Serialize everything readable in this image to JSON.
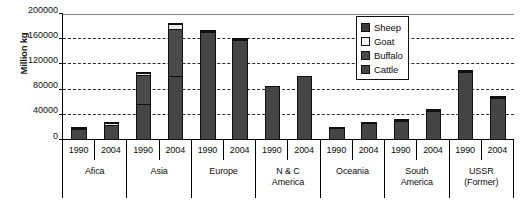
{
  "chart_data": {
    "type": "bar",
    "title": "",
    "subtitle": "",
    "xlabel": "",
    "ylabel": "Million kg",
    "ylim": [
      0,
      200000
    ],
    "ytick_interval": 40000,
    "yticks": [
      200000,
      160000,
      120000,
      80000,
      40000,
      0
    ],
    "ytick_labels": [
      "200000",
      "160000",
      "120000",
      "80000",
      "40000",
      "0"
    ],
    "grid": "horizontal-dashed",
    "stacked": true,
    "legend_position": "top-right",
    "legend": [
      "Sheep",
      "Goat",
      "Buffalo",
      "Cattle"
    ],
    "categories": [
      "Afica 1990",
      "Afica 2004",
      "Asia 1990",
      "Asia 2004",
      "Europe 1990",
      "Europe 2004",
      "N & C America 1990",
      "N & C America 2004",
      "Oceania 1990",
      "Oceania 2004",
      "South America 1990",
      "South America 2004",
      "USSR (Former) 1990",
      "USSR (Former) 2004"
    ],
    "series": [
      {
        "name": "Cattle",
        "color": "#454545",
        "values": [
          18000,
          25000,
          58000,
          102000,
          173000,
          160000,
          86000,
          101000,
          19500,
          28000,
          33000,
          49000,
          110000,
          69000
        ]
      },
      {
        "name": "Buffalo",
        "color": "#4a4a4a",
        "values": [
          0,
          0,
          46000,
          74000,
          0,
          0,
          0,
          0,
          0,
          0,
          0,
          0,
          0,
          0
        ]
      },
      {
        "name": "Goat",
        "color": "#e8e8e8",
        "values": [
          1600,
          2200,
          4000,
          9000,
          1000,
          900,
          0,
          0,
          0,
          0,
          800,
          700,
          900,
          700
        ]
      },
      {
        "name": "Sheep",
        "color": "#3a3a3a",
        "values": [
          800,
          800,
          700,
          1000,
          500,
          400,
          0,
          0,
          500,
          700,
          300,
          300,
          400,
          300
        ]
      }
    ],
    "regions": [
      {
        "name": "Afica",
        "name_lines": [
          "Afica"
        ],
        "years": [
          "1990",
          "2004"
        ],
        "bars": [
          {
            "year": "1990",
            "total": 20400,
            "segments": [
              {
                "series": "Cattle",
                "value": 18000
              },
              {
                "series": "Buffalo",
                "value": 0
              },
              {
                "series": "Goat",
                "value": 1600
              },
              {
                "series": "Sheep",
                "value": 800
              }
            ]
          },
          {
            "year": "2004",
            "total": 28000,
            "segments": [
              {
                "series": "Cattle",
                "value": 25000
              },
              {
                "series": "Buffalo",
                "value": 0
              },
              {
                "series": "Goat",
                "value": 2200
              },
              {
                "series": "Sheep",
                "value": 800
              }
            ]
          }
        ]
      },
      {
        "name": "Asia",
        "name_lines": [
          "Asia"
        ],
        "years": [
          "1990",
          "2004"
        ],
        "bars": [
          {
            "year": "1990",
            "total": 108700,
            "segments": [
              {
                "series": "Cattle",
                "value": 58000
              },
              {
                "series": "Buffalo",
                "value": 46000
              },
              {
                "series": "Goat",
                "value": 4000
              },
              {
                "series": "Sheep",
                "value": 700
              }
            ]
          },
          {
            "year": "2004",
            "total": 186000,
            "segments": [
              {
                "series": "Cattle",
                "value": 102000
              },
              {
                "series": "Buffalo",
                "value": 74000
              },
              {
                "series": "Goat",
                "value": 9000
              },
              {
                "series": "Sheep",
                "value": 1000
              }
            ]
          }
        ]
      },
      {
        "name": "Europe",
        "name_lines": [
          "Europe"
        ],
        "years": [
          "1990",
          "2004"
        ],
        "bars": [
          {
            "year": "1990",
            "total": 174500,
            "segments": [
              {
                "series": "Cattle",
                "value": 173000
              },
              {
                "series": "Buffalo",
                "value": 0
              },
              {
                "series": "Goat",
                "value": 1000
              },
              {
                "series": "Sheep",
                "value": 500
              }
            ]
          },
          {
            "year": "2004",
            "total": 161300,
            "segments": [
              {
                "series": "Cattle",
                "value": 160000
              },
              {
                "series": "Buffalo",
                "value": 0
              },
              {
                "series": "Goat",
                "value": 900
              },
              {
                "series": "Sheep",
                "value": 400
              }
            ]
          }
        ]
      },
      {
        "name": "N & C America",
        "name_lines": [
          "N & C",
          "America"
        ],
        "years": [
          "1990",
          "2004"
        ],
        "bars": [
          {
            "year": "1990",
            "total": 86000,
            "segments": [
              {
                "series": "Cattle",
                "value": 86000
              },
              {
                "series": "Buffalo",
                "value": 0
              },
              {
                "series": "Goat",
                "value": 0
              },
              {
                "series": "Sheep",
                "value": 0
              }
            ]
          },
          {
            "year": "2004",
            "total": 101000,
            "segments": [
              {
                "series": "Cattle",
                "value": 101000
              },
              {
                "series": "Buffalo",
                "value": 0
              },
              {
                "series": "Goat",
                "value": 0
              },
              {
                "series": "Sheep",
                "value": 0
              }
            ]
          }
        ]
      },
      {
        "name": "Oceania",
        "name_lines": [
          "Oceania"
        ],
        "years": [
          "1990",
          "2004"
        ],
        "bars": [
          {
            "year": "1990",
            "total": 20000,
            "segments": [
              {
                "series": "Cattle",
                "value": 19500
              },
              {
                "series": "Buffalo",
                "value": 0
              },
              {
                "series": "Goat",
                "value": 0
              },
              {
                "series": "Sheep",
                "value": 500
              }
            ]
          },
          {
            "year": "2004",
            "total": 28700,
            "segments": [
              {
                "series": "Cattle",
                "value": 28000
              },
              {
                "series": "Buffalo",
                "value": 0
              },
              {
                "series": "Goat",
                "value": 0
              },
              {
                "series": "Sheep",
                "value": 700
              }
            ]
          }
        ]
      },
      {
        "name": "South America",
        "name_lines": [
          "South",
          "America"
        ],
        "years": [
          "1990",
          "2004"
        ],
        "bars": [
          {
            "year": "1990",
            "total": 34100,
            "segments": [
              {
                "series": "Cattle",
                "value": 33000
              },
              {
                "series": "Buffalo",
                "value": 0
              },
              {
                "series": "Goat",
                "value": 800
              },
              {
                "series": "Sheep",
                "value": 300
              }
            ]
          },
          {
            "year": "2004",
            "total": 50000,
            "segments": [
              {
                "series": "Cattle",
                "value": 49000
              },
              {
                "series": "Buffalo",
                "value": 0
              },
              {
                "series": "Goat",
                "value": 700
              },
              {
                "series": "Sheep",
                "value": 300
              }
            ]
          }
        ]
      },
      {
        "name": "USSR (Former)",
        "name_lines": [
          "USSR",
          "(Former)"
        ],
        "years": [
          "1990",
          "2004"
        ],
        "bars": [
          {
            "year": "1990",
            "total": 111300,
            "segments": [
              {
                "series": "Cattle",
                "value": 110000
              },
              {
                "series": "Buffalo",
                "value": 0
              },
              {
                "series": "Goat",
                "value": 900
              },
              {
                "series": "Sheep",
                "value": 400
              }
            ]
          },
          {
            "year": "2004",
            "total": 70000,
            "segments": [
              {
                "series": "Cattle",
                "value": 69000
              },
              {
                "series": "Buffalo",
                "value": 0
              },
              {
                "series": "Goat",
                "value": 700
              },
              {
                "series": "Sheep",
                "value": 300
              }
            ]
          }
        ]
      }
    ]
  }
}
